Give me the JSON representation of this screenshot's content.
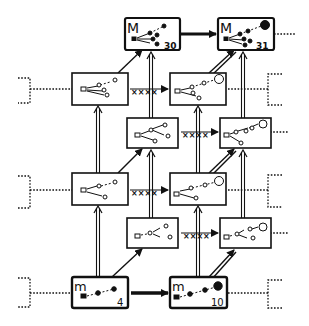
{
  "diagram": {
    "type": "lattice-of-states",
    "colors": {
      "ink": "#111111",
      "background": "#ffffff"
    },
    "nodes": [
      {
        "id": "M30",
        "letter": "M",
        "number": "30",
        "kind": "major"
      },
      {
        "id": "M31",
        "letter": "M",
        "number": "31",
        "kind": "major"
      },
      {
        "id": "r2a",
        "kind": "open"
      },
      {
        "id": "r2b",
        "kind": "open"
      },
      {
        "id": "r3a",
        "kind": "open-inner"
      },
      {
        "id": "r3b",
        "kind": "open-inner"
      },
      {
        "id": "r4a",
        "kind": "open"
      },
      {
        "id": "r4b",
        "kind": "open"
      },
      {
        "id": "r5a",
        "kind": "open-inner"
      },
      {
        "id": "r5b",
        "kind": "open-inner"
      },
      {
        "id": "m4",
        "letter": "m",
        "number": "4",
        "kind": "minor"
      },
      {
        "id": "m10",
        "letter": "m",
        "number": "10",
        "kind": "minor"
      }
    ],
    "edge_marks": {
      "blocked": "××××"
    },
    "legend": []
  }
}
